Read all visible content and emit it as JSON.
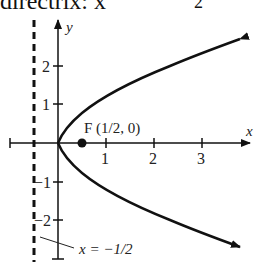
{
  "header": {
    "text": "directrix: x",
    "fraction_denominator": "2"
  },
  "diagram": {
    "axis_labels": {
      "x": "x",
      "y": "y"
    },
    "x_ticks": [
      "1",
      "2",
      "3"
    ],
    "y_ticks": [
      "2",
      "1",
      "−1",
      "−2"
    ],
    "focus_label": "F (1/2, 0)",
    "directrix_label": "x = −1/2"
  }
}
